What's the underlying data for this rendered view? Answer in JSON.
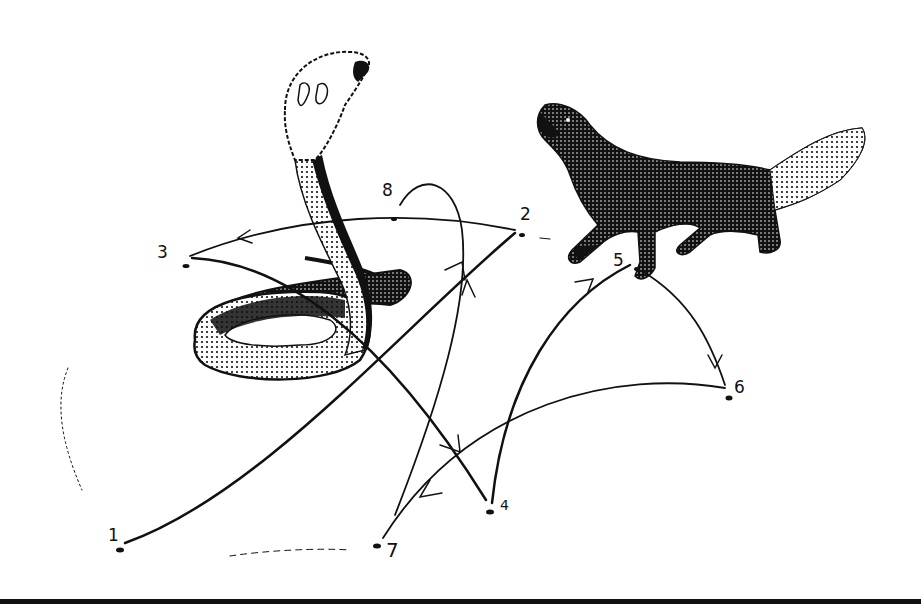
{
  "figure": {
    "subjects": [
      "cobra",
      "mongoose"
    ],
    "ink_color": "#111111",
    "background_color": "#ffffff"
  },
  "points": [
    {
      "id": "1",
      "label": "1",
      "x": 120,
      "y": 550,
      "lx": 108,
      "ly": 527
    },
    {
      "id": "2",
      "label": "2",
      "x": 522,
      "y": 235,
      "lx": 520,
      "ly": 206
    },
    {
      "id": "3",
      "label": "3",
      "x": 186,
      "y": 266,
      "lx": 157,
      "ly": 244
    },
    {
      "id": "4",
      "label": "4",
      "x": 490,
      "y": 512,
      "lx": 500,
      "ly": 498
    },
    {
      "id": "5",
      "label": "5",
      "x": 637,
      "y": 269,
      "lx": 613,
      "ly": 252
    },
    {
      "id": "6",
      "label": "6",
      "x": 729,
      "y": 398,
      "lx": 734,
      "ly": 379
    },
    {
      "id": "7",
      "label": "7",
      "x": 377,
      "y": 546,
      "lx": 386,
      "ly": 540
    },
    {
      "id": "8",
      "label": "8",
      "x": 394,
      "y": 219,
      "lx": 382,
      "ly": 182
    }
  ],
  "path_order": [
    "1",
    "2",
    "3",
    "4",
    "5",
    "6",
    "7",
    "8"
  ]
}
